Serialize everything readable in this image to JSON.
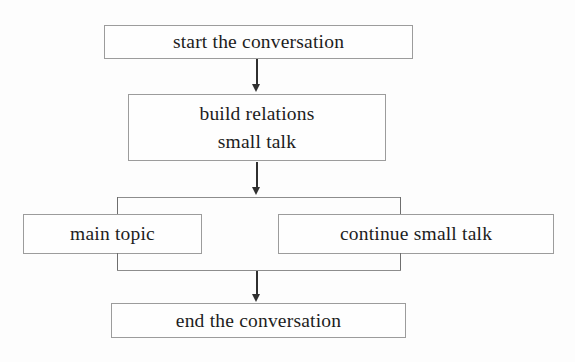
{
  "diagram": {
    "type": "flowchart",
    "orientation": "top-to-bottom",
    "nodes": {
      "start": {
        "label": "start the conversation"
      },
      "build": {
        "line1": "build relations",
        "line2": "small talk"
      },
      "main_topic": {
        "label": "main topic"
      },
      "continue_small_talk": {
        "label": "continue small talk"
      },
      "end": {
        "label": "end the conversation"
      }
    },
    "colors": {
      "background": "#fdfdfd",
      "box_border": "#9c9c9c",
      "text": "#1d1d1d",
      "connector": "#8d8d8d",
      "arrow": "#2f2f2f"
    }
  }
}
